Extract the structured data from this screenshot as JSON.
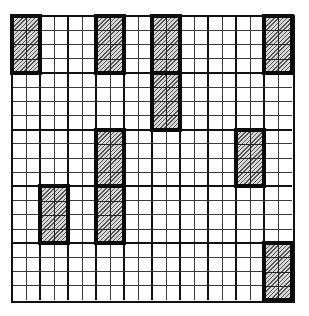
{
  "diagram": {
    "type": "grid-with-shaded-blocks",
    "columns": 20,
    "rows": 20,
    "column_groups": 10,
    "row_bands": 5,
    "cells_per_group_x": 2,
    "cells_per_band_y": 4,
    "colors": {
      "background": "#ffffff",
      "grid_line": "#3a3a3a",
      "group_line": "#111111",
      "block_border": "#0a0a0a",
      "hatch_dark": "#555555",
      "hatch_light": "#d8d8d8"
    },
    "shaded_blocks": [
      {
        "band": 0,
        "group": 0
      },
      {
        "band": 0,
        "group": 3
      },
      {
        "band": 0,
        "group": 5
      },
      {
        "band": 0,
        "group": 9
      },
      {
        "band": 1,
        "group": 5
      },
      {
        "band": 2,
        "group": 3
      },
      {
        "band": 2,
        "group": 8
      },
      {
        "band": 3,
        "group": 1
      },
      {
        "band": 3,
        "group": 3
      },
      {
        "band": 4,
        "group": 9
      }
    ]
  }
}
